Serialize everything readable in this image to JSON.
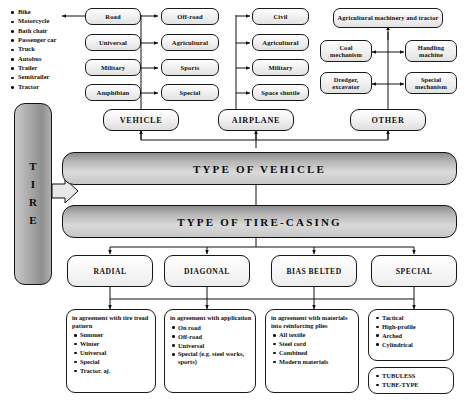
{
  "diagram": {
    "colors": {
      "ink": "#111111",
      "node_fill_light": "#f2f2f2",
      "banner_dark": "#8d8d8d",
      "banner_light": "#dadada",
      "tire_fill": "#a9a9a9"
    }
  },
  "vehicle_examples": {
    "items": [
      "Bike",
      "Motorcycle",
      "Bath chair",
      "Passenger car",
      "Truck",
      "Autobus",
      "Trailer",
      "Semitrailer",
      "Tractor"
    ]
  },
  "root": {
    "label_letters": [
      "T",
      "I",
      "R",
      "E"
    ],
    "label": "TIRE"
  },
  "vehicle_group": {
    "category": "VEHICLE",
    "left_column": [
      "Road",
      "Universal",
      "Military",
      "Amphibian"
    ],
    "right_column": [
      "Off-road",
      "Agricultural",
      "Sports",
      "Special"
    ]
  },
  "airplane_group": {
    "category": "AIRPLANE",
    "column": [
      "Civil",
      "Agricultural",
      "Military",
      "Space shuttle"
    ]
  },
  "other_group": {
    "category": "OTHER",
    "top": "Agricultural machinery and tractor",
    "left_column": [
      "Coal mechanism",
      "Dredger, excavator"
    ],
    "right_column": [
      "Handling machine",
      "Special mechanism"
    ]
  },
  "banners": {
    "vehicle_type": "TYPE OF VEHICLE",
    "casing_type": "TYPE OF TIRE-CASING"
  },
  "casing_types": [
    {
      "label": "RADIAL"
    },
    {
      "label": "DIAGONAL"
    },
    {
      "label": "BIAS BELTED"
    },
    {
      "label": "SPECIAL"
    }
  ],
  "details": [
    {
      "head": "in agreement with tire tread pattern",
      "items": [
        "Summer",
        "Winter",
        "Universal",
        "Special",
        "Tractor. aj."
      ]
    },
    {
      "head": "in agreement with application",
      "items": [
        "On road",
        "Off-road",
        "Universal",
        "Special (e.g. steel works, sports)"
      ]
    },
    {
      "head": "in agreement with materials into reinforcing plies",
      "items": [
        "All textile",
        "Steel cord",
        "Combined",
        "Modern materials"
      ]
    },
    {
      "head": "",
      "items": [
        "Tactical",
        "High-profile",
        "Arched",
        "Cylindrical"
      ]
    }
  ],
  "tube_box": {
    "items": [
      "TUBULESS",
      "TUBE-TYPE"
    ]
  }
}
